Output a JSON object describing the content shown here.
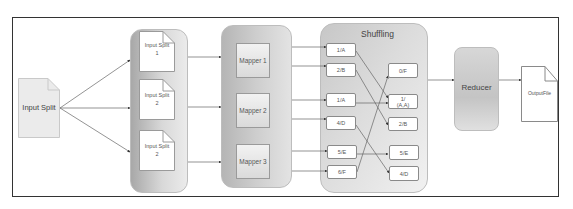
{
  "diagram": {
    "input": {
      "label": "Input Split"
    },
    "splits": [
      {
        "label": "Input Split",
        "number": "1"
      },
      {
        "label": "Input Split",
        "number": "2"
      },
      {
        "label": "Input Split",
        "number": "2"
      }
    ],
    "mappers": [
      {
        "label": "Mapper 1"
      },
      {
        "label": "Mapper 2"
      },
      {
        "label": "Mapper 3"
      }
    ],
    "shuffling": {
      "title": "Shuffling",
      "inputs": [
        "1/A",
        "2/B",
        "1/A",
        "4/D",
        "5/E",
        "6/F"
      ],
      "outputs": [
        "0/F",
        "1/\n(A,A)",
        "2/B",
        "5/E",
        "4/D"
      ]
    },
    "reducer": {
      "label": "Reducer"
    },
    "output": {
      "label": "OutputFile"
    },
    "colors": {
      "frame": "#333333",
      "container_gray": "#c8c8c8",
      "line": "#555555",
      "box_border": "#8a8a8a"
    }
  }
}
